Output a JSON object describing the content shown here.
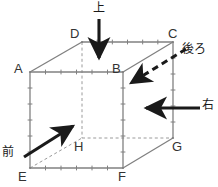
{
  "figure": {
    "type": "geometry-diagram",
    "background_color": "#ffffff",
    "edge_color": "#808080",
    "hidden_edge_color": "#9a9a9a",
    "arrow_color": "#1a1a1a",
    "label_color": "#333333"
  },
  "vertices": [
    {
      "id": "A",
      "label": "A",
      "x": 30,
      "y": 72,
      "label_x": 14,
      "label_y": 62,
      "hidden": false
    },
    {
      "id": "B",
      "label": "B",
      "x": 123,
      "y": 72,
      "label_x": 112,
      "label_y": 62,
      "hidden": false
    },
    {
      "id": "C",
      "label": "C",
      "x": 173,
      "y": 42,
      "label_x": 168,
      "label_y": 27,
      "hidden": false
    },
    {
      "id": "D",
      "label": "D",
      "x": 82,
      "y": 42,
      "label_x": 70,
      "label_y": 27,
      "hidden": false
    },
    {
      "id": "E",
      "label": "E",
      "x": 30,
      "y": 168,
      "label_x": 18,
      "label_y": 170,
      "hidden": false
    },
    {
      "id": "F",
      "label": "F",
      "x": 123,
      "y": 168,
      "label_x": 118,
      "label_y": 170,
      "hidden": false
    },
    {
      "id": "G",
      "label": "G",
      "x": 173,
      "y": 138,
      "label_x": 172,
      "label_y": 140,
      "hidden": false
    },
    {
      "id": "H",
      "label": "H",
      "x": 82,
      "y": 138,
      "label_x": 74,
      "label_y": 140,
      "hidden": true
    }
  ],
  "edges": [
    {
      "from": "A",
      "to": "B",
      "hidden": false,
      "ticks": 6
    },
    {
      "from": "B",
      "to": "F",
      "hidden": false,
      "ticks": 6
    },
    {
      "from": "F",
      "to": "E",
      "hidden": false,
      "ticks": 6
    },
    {
      "from": "E",
      "to": "A",
      "hidden": false,
      "ticks": 6
    },
    {
      "from": "D",
      "to": "C",
      "hidden": false,
      "ticks": 6
    },
    {
      "from": "C",
      "to": "G",
      "hidden": false,
      "ticks": 6
    },
    {
      "from": "A",
      "to": "D",
      "hidden": false,
      "ticks": 0
    },
    {
      "from": "B",
      "to": "C",
      "hidden": false,
      "ticks": 0
    },
    {
      "from": "F",
      "to": "G",
      "hidden": false,
      "ticks": 0
    },
    {
      "from": "D",
      "to": "H",
      "hidden": true,
      "ticks": 0
    },
    {
      "from": "H",
      "to": "G",
      "hidden": true,
      "ticks": 0
    },
    {
      "from": "E",
      "to": "H",
      "hidden": true,
      "ticks": 0
    }
  ],
  "arrows": [
    {
      "id": "top",
      "label": "上",
      "meaning": "ue-top",
      "style": "solid",
      "x1": 99,
      "y1": 19,
      "x2": 99,
      "y2": 58,
      "label_x": 93,
      "label_y": 2
    },
    {
      "id": "back",
      "label": "後ろ",
      "meaning": "ushiro-back",
      "style": "dashed",
      "x1": 186,
      "y1": 49,
      "x2": 131,
      "y2": 83,
      "label_x": 182,
      "label_y": 43
    },
    {
      "id": "right",
      "label": "右",
      "meaning": "migi-right",
      "style": "solid",
      "x1": 200,
      "y1": 108,
      "x2": 146,
      "y2": 108,
      "label_x": 202,
      "label_y": 99
    },
    {
      "id": "front",
      "label": "前",
      "meaning": "mae-front",
      "style": "solid",
      "x1": 24,
      "y1": 157,
      "x2": 73,
      "y2": 126,
      "label_x": 2,
      "label_y": 146
    }
  ]
}
